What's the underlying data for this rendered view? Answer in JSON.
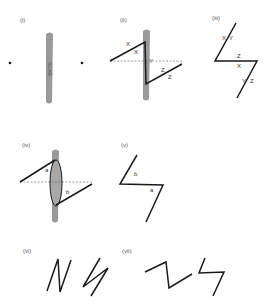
{
  "panels": [
    {
      "id": "i",
      "label": "(i)",
      "scar_text": "SCAR"
    },
    {
      "id": "ii",
      "label": "(ii)",
      "marks": [
        "X",
        "X",
        "Y",
        "Z",
        "Z"
      ]
    },
    {
      "id": "iii",
      "label": "(iii)",
      "marks": [
        "X",
        "Y",
        "Z",
        "X",
        "Y",
        "Z"
      ]
    },
    {
      "id": "iv",
      "label": "(iv)",
      "marks": [
        "a",
        "b"
      ]
    },
    {
      "id": "v",
      "label": "(v)",
      "marks": [
        "b",
        "a"
      ]
    },
    {
      "id": "vi",
      "label": "(vi)"
    },
    {
      "id": "vii",
      "label": "(vii)"
    }
  ],
  "colors": {
    "line": "#1a1a1a",
    "scar": "#9a9a9a",
    "dash": "#777777",
    "text": "#555555"
  }
}
